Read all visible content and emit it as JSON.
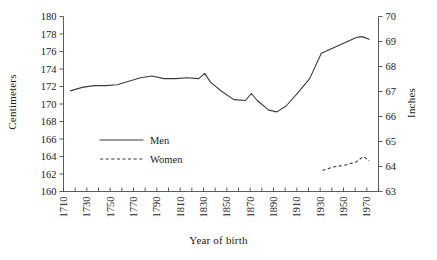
{
  "chart_data": {
    "type": "line",
    "title": "",
    "xlabel": "Year of birth",
    "ylabel": "Centimeters",
    "ylabel_secondary": "Inches",
    "xlim": [
      1710,
      1980
    ],
    "ylim": [
      160,
      180
    ],
    "ylim_secondary": [
      63,
      70
    ],
    "grid": false,
    "legend_position": "center-left",
    "x_tick_labels": [
      "1710",
      "1730",
      "1750",
      "1770",
      "1790",
      "1810",
      "1830",
      "1850",
      "1870",
      "1890",
      "1910",
      "1930",
      "1950",
      "1970"
    ],
    "x_tick_values": [
      1710,
      1730,
      1750,
      1770,
      1790,
      1810,
      1830,
      1850,
      1870,
      1890,
      1910,
      1930,
      1950,
      1970
    ],
    "x_minor_tick_values": [
      1720,
      1740,
      1760,
      1780,
      1800,
      1820,
      1840,
      1860,
      1880,
      1900,
      1920,
      1940,
      1960,
      1980
    ],
    "y_tick_labels": [
      "160",
      "162",
      "164",
      "166",
      "168",
      "170",
      "172",
      "174",
      "176",
      "178",
      "180"
    ],
    "y_tick_values": [
      160,
      162,
      164,
      166,
      168,
      170,
      172,
      174,
      176,
      178,
      180
    ],
    "y_secondary_tick_labels": [
      "63",
      "64",
      "65",
      "66",
      "67",
      "68",
      "69",
      "70"
    ],
    "y_secondary_tick_values": [
      63,
      64,
      65,
      66,
      67,
      68,
      69,
      70
    ],
    "series": [
      {
        "name": "Men",
        "style": "solid",
        "color": "#3a3a3a",
        "x": [
          1716,
          1726,
          1736,
          1746,
          1756,
          1766,
          1776,
          1786,
          1796,
          1806,
          1816,
          1826,
          1831,
          1836,
          1846,
          1856,
          1866,
          1871,
          1876,
          1886,
          1893,
          1901,
          1911,
          1921,
          1931,
          1941,
          1951,
          1961,
          1966,
          1972
        ],
        "y": [
          171.5,
          171.9,
          172.1,
          172.1,
          172.2,
          172.6,
          173.0,
          173.2,
          172.9,
          172.9,
          173.0,
          172.9,
          173.5,
          172.5,
          171.4,
          170.5,
          170.4,
          171.2,
          170.4,
          169.3,
          169.1,
          169.8,
          171.3,
          172.9,
          175.8,
          176.4,
          177.0,
          177.6,
          177.7,
          177.4
        ]
      },
      {
        "name": "Women",
        "style": "dashed",
        "color": "#3a3a3a",
        "x": [
          1932,
          1941,
          1951,
          1961,
          1967,
          1972
        ],
        "y": [
          162.4,
          162.8,
          163.0,
          163.4,
          164.0,
          163.5
        ]
      }
    ]
  },
  "legend": {
    "items": [
      {
        "label": "Men",
        "style": "solid"
      },
      {
        "label": "Women",
        "style": "dashed"
      }
    ]
  },
  "axes": {
    "left_title": "Centimeters",
    "right_title": "Inches",
    "bottom_title": "Year of birth"
  }
}
